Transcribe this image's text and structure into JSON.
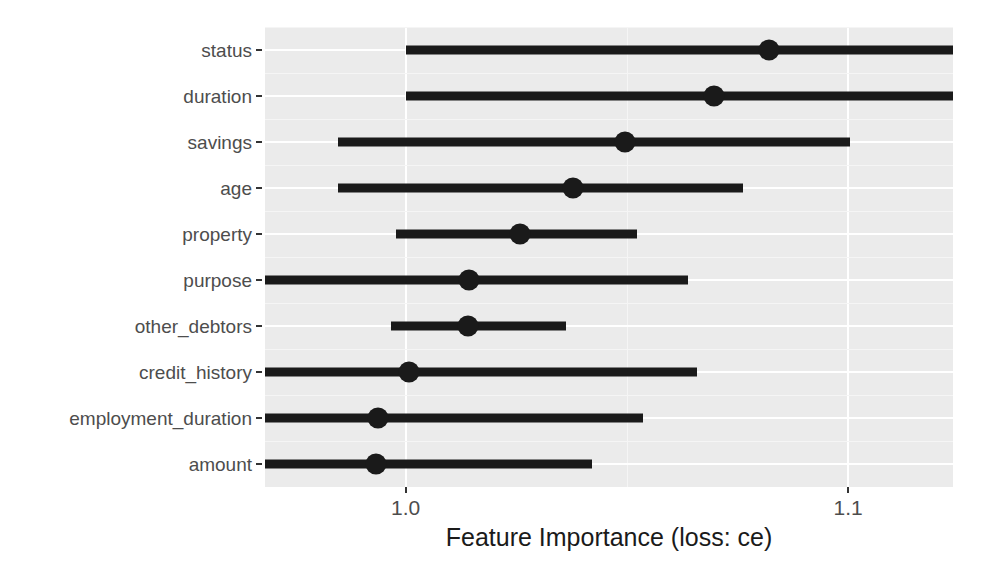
{
  "chart_data": {
    "type": "bar",
    "subtype": "horizontal-interval-dot-plot",
    "title": "",
    "subtitle": "",
    "xlabel": "Feature Importance (loss: ce)",
    "ylabel": "",
    "grid": true,
    "legend": null,
    "xlim": [
      0.9682,
      1.1237
    ],
    "xticks": [
      1.0,
      1.1
    ],
    "xticklabels": [
      "1.0",
      "1.1"
    ],
    "categories": [
      "status",
      "duration",
      "savings",
      "age",
      "property",
      "purpose",
      "other_debtors",
      "credit_history",
      "employment_duration",
      "amount"
    ],
    "values": [
      1.0822,
      1.0696,
      1.0496,
      1.0378,
      1.0259,
      1.0144,
      1.0141,
      1.0007,
      0.9937,
      0.9933
    ],
    "lower": [
      1.0,
      1.0,
      0.9848,
      0.9848,
      0.9978,
      0.9526,
      0.9967,
      0.9363,
      0.9363,
      0.9363
    ],
    "upper": [
      1.1648,
      1.1648,
      1.1004,
      1.0763,
      1.0522,
      1.0637,
      1.0363,
      1.0659,
      1.0537,
      1.0422
    ],
    "series": [
      {
        "name": "Feature importance interval",
        "points": [
          {
            "category": "status",
            "value": 1.0822,
            "lower": 1.0,
            "upper": 1.1648
          },
          {
            "category": "duration",
            "value": 1.0696,
            "lower": 1.0,
            "upper": 1.1648
          },
          {
            "category": "savings",
            "value": 1.0496,
            "lower": 0.9848,
            "upper": 1.1004
          },
          {
            "category": "age",
            "value": 1.0378,
            "lower": 0.9848,
            "upper": 1.0763
          },
          {
            "category": "property",
            "value": 1.0259,
            "lower": 0.9978,
            "upper": 1.0522
          },
          {
            "category": "purpose",
            "value": 1.0144,
            "lower": 0.9526,
            "upper": 1.0637
          },
          {
            "category": "other_debtors",
            "value": 1.0141,
            "lower": 0.9967,
            "upper": 1.0363
          },
          {
            "category": "credit_history",
            "value": 1.0007,
            "lower": 0.9363,
            "upper": 1.0659
          },
          {
            "category": "employment_duration",
            "value": 0.9937,
            "lower": 0.9363,
            "upper": 1.0537
          },
          {
            "category": "amount",
            "value": 0.9933,
            "lower": 0.9363,
            "upper": 1.0422
          }
        ]
      }
    ],
    "colors": {
      "bar": "#1a1a1a",
      "dot": "#1a1a1a",
      "panel_background": "#ebebeb",
      "gridline": "#ffffff",
      "axis_text": "#4d4d4d",
      "axis_title": "#1a1a1a"
    }
  }
}
